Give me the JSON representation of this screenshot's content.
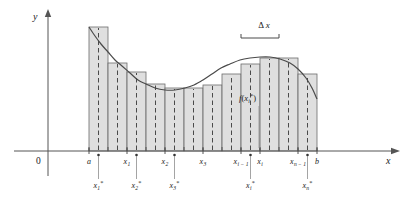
{
  "figure": {
    "background": "#ffffff",
    "rect_fill": "#d9d9d9",
    "rect_stroke": "#6b6b6b",
    "curve_color": "#4a4a4a",
    "axis_color": "#555555"
  },
  "axes": {
    "y_label": "y",
    "x_label": "x",
    "origin_label": "0",
    "x_axis_y": 151,
    "y_axis_x": 48,
    "x_axis_start": 14,
    "x_axis_end": 392,
    "y_axis_top": 16,
    "y_axis_bottom": 176
  },
  "interval": {
    "a_label": "a",
    "b_label": "b",
    "a_x": 89,
    "b_x": 317
  },
  "chart_data": {
    "type": "area",
    "xlabel": "x",
    "ylabel": "y",
    "n_subintervals": 12,
    "delta_x": 19,
    "partition_px": [
      89,
      108,
      127,
      146,
      165,
      184,
      203,
      222,
      241,
      260,
      279,
      298,
      317
    ],
    "sample_points_px": [
      98.5,
      117.5,
      136.5,
      155.5,
      174.5,
      193.5,
      212.5,
      231.5,
      250.5,
      269.5,
      288.5,
      307.5
    ],
    "rect_top_px": [
      27,
      63,
      72,
      84,
      88,
      88,
      85,
      74,
      64,
      58,
      58,
      74
    ],
    "curve_points_px": [
      [
        89,
        27
      ],
      [
        95,
        36
      ],
      [
        101,
        44
      ],
      [
        108,
        52
      ],
      [
        115,
        60
      ],
      [
        122,
        66
      ],
      [
        130,
        73
      ],
      [
        138,
        80
      ],
      [
        146,
        84
      ],
      [
        155,
        88
      ],
      [
        165,
        90
      ],
      [
        175,
        90
      ],
      [
        185,
        88
      ],
      [
        194,
        85
      ],
      [
        203,
        80
      ],
      [
        212,
        74
      ],
      [
        221,
        68
      ],
      [
        230,
        64
      ],
      [
        240,
        60
      ],
      [
        250,
        58
      ],
      [
        260,
        57
      ],
      [
        270,
        57
      ],
      [
        280,
        59
      ],
      [
        290,
        63
      ],
      [
        298,
        69
      ],
      [
        306,
        78
      ],
      [
        312,
        88
      ],
      [
        317,
        99
      ]
    ],
    "axis_ticks": [
      {
        "label": "a",
        "sub": "",
        "x": 89
      },
      {
        "label": "x",
        "sub": "1",
        "x": 127
      },
      {
        "label": "x",
        "sub": "2",
        "x": 165
      },
      {
        "label": "x",
        "sub": "3",
        "x": 203
      },
      {
        "label": "x",
        "sub": "i − 1",
        "x": 241
      },
      {
        "label": "x",
        "sub": "i",
        "x": 260
      },
      {
        "label": "x",
        "sub": "n − 1",
        "x": 298
      },
      {
        "label": "b",
        "sub": "",
        "x": 317
      }
    ],
    "sample_labels": [
      {
        "base": "x",
        "sub": "1",
        "star": "*",
        "x": 98.5,
        "tick_x": 98.5,
        "label_y": 188
      },
      {
        "base": "x",
        "sub": "2",
        "star": "*",
        "x": 136.5,
        "tick_x": 136.5,
        "label_y": 188
      },
      {
        "base": "x",
        "sub": "3",
        "star": "*",
        "x": 174.5,
        "tick_x": 174.5,
        "label_y": 188
      },
      {
        "base": "x",
        "sub": "i",
        "star": "*",
        "x": 250.5,
        "tick_x": 250.5,
        "label_y": 188
      },
      {
        "base": "x",
        "sub": "n",
        "star": "*",
        "x": 307.5,
        "tick_x": 307.5,
        "label_y": 188
      }
    ]
  },
  "annotations": {
    "delta_x": {
      "text": "Δx",
      "symbol": "Δ",
      "var": "x",
      "label_x": 264,
      "label_y": 28,
      "brace_left": 241,
      "brace_right": 279,
      "brace_y": 38
    },
    "f_value": {
      "base": "f",
      "open": "(",
      "var": "x",
      "sub": "i",
      "star": "*",
      "close": ")",
      "text": "f(xᵢ*)",
      "x": 239,
      "y": 101,
      "leader_x": 259,
      "leader_top": 106,
      "leader_bottom": 148
    }
  }
}
